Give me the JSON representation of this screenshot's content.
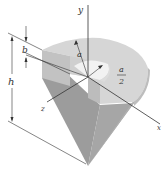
{
  "figure": {
    "colors": {
      "top_face": "#d9d9d9",
      "cone_side_dark": "#9a9a9a",
      "cone_side_light": "#b3b3b3",
      "cut_face": "#c4c4c4",
      "cavity": "#f0f0f0",
      "line": "#333333"
    }
  },
  "axes": {
    "x_label": "x",
    "y_label": "y",
    "z_label": "z"
  },
  "dimensions": {
    "h_label": "h",
    "b_label": "b",
    "a_label": "a",
    "a_half_num": "a",
    "a_half_den": "2"
  }
}
